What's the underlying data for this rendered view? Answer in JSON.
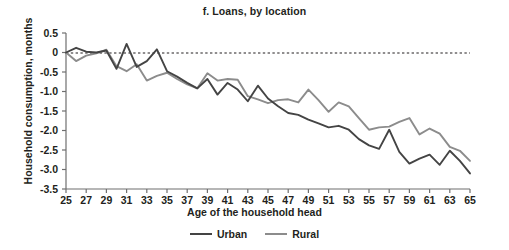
{
  "chart_data": {
    "type": "line",
    "title": "f. Loans, by location",
    "xlabel": "Age of the household head",
    "ylabel": "Household consumption, months",
    "xlim": [
      25,
      65
    ],
    "ylim": [
      -3.5,
      0.5
    ],
    "grid": false,
    "zero_reference_line": true,
    "legend_position": "bottom",
    "xticks": [
      25,
      27,
      29,
      31,
      33,
      35,
      37,
      39,
      41,
      43,
      45,
      47,
      49,
      51,
      53,
      55,
      57,
      59,
      61,
      63,
      65
    ],
    "xtick_labels": [
      "25",
      "27",
      "29",
      "31",
      "33",
      "35",
      "37",
      "39",
      "41",
      "43",
      "45",
      "47",
      "49",
      "51",
      "53",
      "55",
      "57",
      "59",
      "61",
      "63",
      "65"
    ],
    "yticks": [
      0.5,
      0,
      -0.5,
      -1.0,
      -1.5,
      -2.0,
      -2.5,
      -3.0,
      -3.5
    ],
    "ytick_labels": [
      "0.5",
      "0",
      "-0.5",
      "-1.0",
      "-1.5",
      "-2.0",
      "-2.5",
      "-3.0",
      "-3.5"
    ],
    "x": [
      25,
      26,
      27,
      28,
      29,
      30,
      31,
      32,
      33,
      34,
      35,
      36,
      37,
      38,
      39,
      40,
      41,
      42,
      43,
      44,
      45,
      46,
      47,
      48,
      49,
      50,
      51,
      52,
      53,
      54,
      55,
      56,
      57,
      58,
      59,
      60,
      61,
      62,
      63,
      64,
      65
    ],
    "series": [
      {
        "name": "Urban",
        "color": "#444444",
        "values": [
          0.0,
          0.12,
          0.02,
          0.0,
          0.05,
          -0.42,
          0.22,
          -0.37,
          -0.22,
          0.08,
          -0.48,
          -0.62,
          -0.78,
          -0.92,
          -0.68,
          -1.08,
          -0.78,
          -0.95,
          -1.25,
          -0.85,
          -1.18,
          -1.38,
          -1.55,
          -1.6,
          -1.72,
          -1.82,
          -1.92,
          -1.88,
          -1.98,
          -2.22,
          -2.38,
          -2.47,
          -1.98,
          -2.55,
          -2.85,
          -2.72,
          -2.62,
          -2.88,
          -2.52,
          -2.78,
          -3.1
        ]
      },
      {
        "name": "Rural",
        "color": "#8c8c8c",
        "values": [
          0.0,
          -0.22,
          -0.08,
          -0.02,
          0.07,
          -0.35,
          -0.48,
          -0.3,
          -0.72,
          -0.6,
          -0.52,
          -0.68,
          -0.82,
          -0.92,
          -0.53,
          -0.72,
          -0.68,
          -0.7,
          -1.12,
          -1.2,
          -1.3,
          -1.22,
          -1.2,
          -1.28,
          -0.95,
          -1.22,
          -1.52,
          -1.28,
          -1.38,
          -1.68,
          -1.98,
          -1.92,
          -1.9,
          -1.78,
          -1.68,
          -2.1,
          -1.95,
          -2.08,
          -2.42,
          -2.52,
          -2.78
        ]
      }
    ]
  },
  "legend": {
    "items": [
      {
        "label": "Urban",
        "color": "#444444"
      },
      {
        "label": "Rural",
        "color": "#8c8c8c"
      }
    ]
  },
  "axis": {
    "zero_line_color": "#231f20",
    "axis_color": "#6f6f6f"
  }
}
